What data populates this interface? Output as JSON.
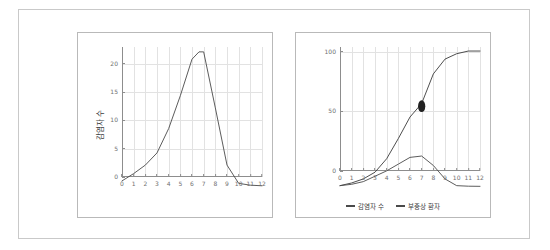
{
  "figure": {
    "frame_border_color": "#c9c9c9",
    "background": "#ffffff"
  },
  "charts": [
    {
      "id": "left",
      "ylabel": "감염자 수",
      "x_ticks": [
        "0",
        "1",
        "2",
        "3",
        "4",
        "5",
        "6",
        "7",
        "8",
        "9",
        "10",
        "11",
        "12"
      ],
      "y_ticks": [
        "0",
        "5",
        "10",
        "15",
        "20"
      ]
    },
    {
      "id": "right",
      "ylabel": "",
      "x_ticks": [
        "0",
        "1",
        "2",
        "3",
        "4",
        "5",
        "6",
        "7",
        "8",
        "9",
        "10",
        "11",
        "12"
      ],
      "y_ticks": [
        "0",
        "50",
        "100"
      ],
      "legend": [
        {
          "label": "감염자 수",
          "color": "#4a4a4a"
        },
        {
          "label": "부중상 환자",
          "color": "#4a4a4a"
        }
      ]
    }
  ],
  "chart_data": [
    {
      "type": "line",
      "id": "left-epidemic-curve",
      "title": "",
      "xlabel": "",
      "ylabel": "감염자 수",
      "xlim": [
        0,
        12
      ],
      "ylim": [
        0,
        23
      ],
      "grid": true,
      "legend_position": "none",
      "line_color": "#4a4a4a",
      "x": [
        0,
        1,
        2,
        3,
        4,
        5,
        6,
        6.6,
        7,
        8,
        9,
        10,
        11,
        12
      ],
      "series": [
        {
          "name": "감염자 수",
          "values": [
            1.0,
            2.2,
            3.6,
            5.6,
            9.6,
            15.0,
            21.0,
            22.2,
            22.2,
            13.0,
            3.6,
            0.6,
            0.3,
            0.2
          ]
        }
      ]
    },
    {
      "type": "line",
      "id": "right-cumulative-and-severe",
      "title": "",
      "xlabel": "",
      "ylabel": "",
      "xlim": [
        0,
        12
      ],
      "ylim": [
        0,
        104
      ],
      "grid": true,
      "legend_position": "bottom",
      "x": [
        0,
        1,
        2,
        3,
        4,
        5,
        6,
        7,
        8,
        9,
        10,
        11,
        12
      ],
      "series": [
        {
          "name": "감염자 수",
          "color": "#3a3a3a",
          "values": [
            1,
            3,
            6,
            11,
            21,
            36,
            52,
            62,
            84,
            95,
            99,
            101,
            101
          ]
        },
        {
          "name": "부중상 환자",
          "color": "#4a4a4a",
          "values": [
            1,
            2,
            4,
            8,
            12,
            17,
            22,
            23,
            16,
            6,
            1,
            0.6,
            0.5
          ]
        }
      ],
      "annotations": [
        {
          "name": "marker-point",
          "x": 7,
          "y": 60,
          "shape": "filled-circle",
          "color": "#222222"
        }
      ]
    }
  ]
}
